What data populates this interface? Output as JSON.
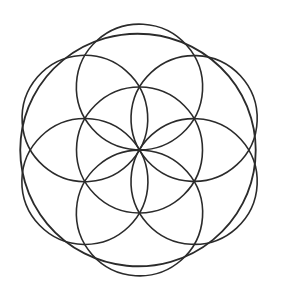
{
  "canvas": {
    "width": 284,
    "height": 297,
    "background_color": "#ffffff",
    "alt_text": "Seed of Life sacred geometry diagram"
  },
  "figure": {
    "name": "Seed of Life",
    "stroke_color": "#2b2b2b",
    "stroke_width": 1.6,
    "fill": "none",
    "symmetry_order": 6,
    "total_circles": 8
  },
  "chart_data": {
    "type": "scatter",
    "xlabel": "",
    "ylabel": "",
    "xlim": [
      0,
      284
    ],
    "ylim": [
      0,
      297
    ],
    "grid": false,
    "legend": "none",
    "center": {
      "cx": 139,
      "cy": 150
    },
    "petal_radius": 63,
    "outer_radius": 117,
    "circles": [
      {
        "id": "outer-boundary",
        "role": "boundary",
        "cx": 138,
        "cy": 150,
        "r": 117
      },
      {
        "id": "petal-center",
        "role": "petal",
        "angle_deg": null,
        "cx": 139.5,
        "cy": 150.0,
        "r": 63
      },
      {
        "id": "petal-top",
        "role": "petal",
        "angle_deg": 270,
        "cx": 139.5,
        "cy": 87.0,
        "r": 63
      },
      {
        "id": "petal-upper-right",
        "role": "petal",
        "angle_deg": 330,
        "cx": 194.1,
        "cy": 118.5,
        "r": 63
      },
      {
        "id": "petal-lower-right",
        "role": "petal",
        "angle_deg": 30,
        "cx": 194.1,
        "cy": 181.5,
        "r": 63
      },
      {
        "id": "petal-bottom",
        "role": "petal",
        "angle_deg": 90,
        "cx": 139.5,
        "cy": 213.0,
        "r": 63
      },
      {
        "id": "petal-lower-left",
        "role": "petal",
        "angle_deg": 150,
        "cx": 84.9,
        "cy": 181.5,
        "r": 63
      },
      {
        "id": "petal-upper-left",
        "role": "petal",
        "angle_deg": 210,
        "cx": 84.9,
        "cy": 118.5,
        "r": 63
      }
    ],
    "intersection_nodes": [
      {
        "id": "node-left",
        "x": 76.5,
        "y": 150.0
      },
      {
        "id": "node-upper-left",
        "x": 108.0,
        "y": 95.4
      },
      {
        "id": "node-upper-right",
        "x": 171.0,
        "y": 95.4
      },
      {
        "id": "node-right",
        "x": 202.5,
        "y": 150.0
      },
      {
        "id": "node-lower-right",
        "x": 171.0,
        "y": 204.6
      },
      {
        "id": "node-lower-left",
        "x": 108.0,
        "y": 204.6
      },
      {
        "id": "node-center",
        "x": 139.5,
        "y": 150.0
      }
    ]
  }
}
